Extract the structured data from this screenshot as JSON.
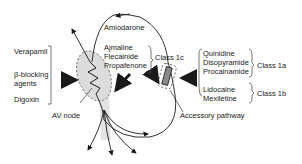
{
  "diagram": {
    "left_drugs": [
      "Verapamil",
      "β-blocking",
      "agents",
      "Digoxin"
    ],
    "center_top": "Amiodarone",
    "class1c_drugs": [
      "Ajmaline",
      "Flecainide",
      "Propafenone"
    ],
    "class1c_label": "Class 1c",
    "class1a_drugs": [
      "Quinidine",
      "Disopyramide",
      "Procainamide"
    ],
    "class1a_label": "Class 1a",
    "class1b_drugs": [
      "Lidocaine",
      "Mexiletine"
    ],
    "class1b_label": "Class 1b",
    "av_node_label": "AV node",
    "accessory_label": "Accessory pathway",
    "colors": {
      "line": "#1a1a1a",
      "node_fill": "#d9d9d9",
      "pathway_fill": "#8a8a8a"
    }
  }
}
